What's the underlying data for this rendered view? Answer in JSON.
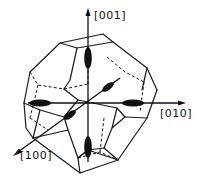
{
  "diagram": {
    "type": "crystal-brillouin-zone",
    "shape": "truncated-octahedron",
    "axes": [
      {
        "id": "z",
        "label": "[001]",
        "direction": "up"
      },
      {
        "id": "y",
        "label": "[010]",
        "direction": "right"
      },
      {
        "id": "x",
        "label": "[100]",
        "direction": "down-left"
      }
    ],
    "ellipsoids": {
      "count": 6,
      "description": "constant-energy ellipsoids along <100> directions"
    },
    "colors": {
      "line": "#1a1a1a",
      "fill": "#111111",
      "background": "#ffffff"
    }
  }
}
